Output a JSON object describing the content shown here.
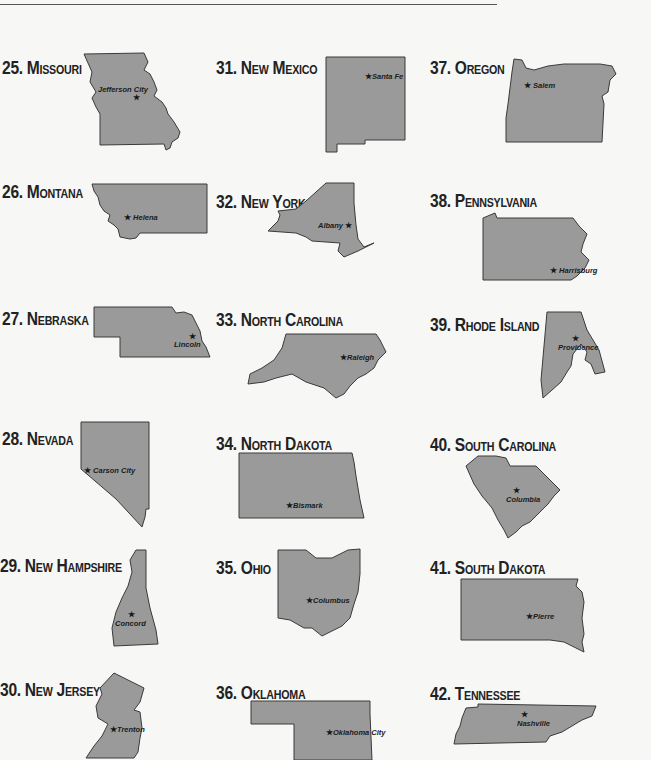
{
  "page": {
    "states": [
      {
        "number": "25.",
        "name": "Missouri",
        "capital": "Jefferson City"
      },
      {
        "number": "26.",
        "name": "Montana",
        "capital": "Helena"
      },
      {
        "number": "27.",
        "name": "Nebraska",
        "capital": "Lincoln"
      },
      {
        "number": "28.",
        "name": "Nevada",
        "capital": "Carson City"
      },
      {
        "number": "29.",
        "name": "New Hampshire",
        "capital": "Concord"
      },
      {
        "number": "30.",
        "name": "New Jersey",
        "capital": "Trenton"
      },
      {
        "number": "31.",
        "name": "New Mexico",
        "capital": "Santa Fe"
      },
      {
        "number": "32.",
        "name": "New York",
        "capital": "Albany"
      },
      {
        "number": "33.",
        "name": "North Carolina",
        "capital": "Raleigh"
      },
      {
        "number": "34.",
        "name": "North Dakota",
        "capital": "Bismark"
      },
      {
        "number": "35.",
        "name": "Ohio",
        "capital": "Columbus"
      },
      {
        "number": "36.",
        "name": "Oklahoma",
        "capital": "Oklahoma City"
      },
      {
        "number": "37.",
        "name": "Oregon",
        "capital": "Salem"
      },
      {
        "number": "38.",
        "name": "Pennsylvania",
        "capital": "Harrisburg"
      },
      {
        "number": "39.",
        "name": "Rhode Island",
        "capital": "Providence"
      },
      {
        "number": "40.",
        "name": "South Carolina",
        "capital": "Columbia"
      },
      {
        "number": "41.",
        "name": "South Dakota",
        "capital": "Pierre"
      },
      {
        "number": "42.",
        "name": "Tennessee",
        "capital": "Nashville"
      }
    ],
    "capital_marker": "★",
    "colors": {
      "state_fill": "#9a9a9a",
      "outline": "#3a3a3a",
      "text": "#222222",
      "background": "#f7f7f5"
    }
  }
}
